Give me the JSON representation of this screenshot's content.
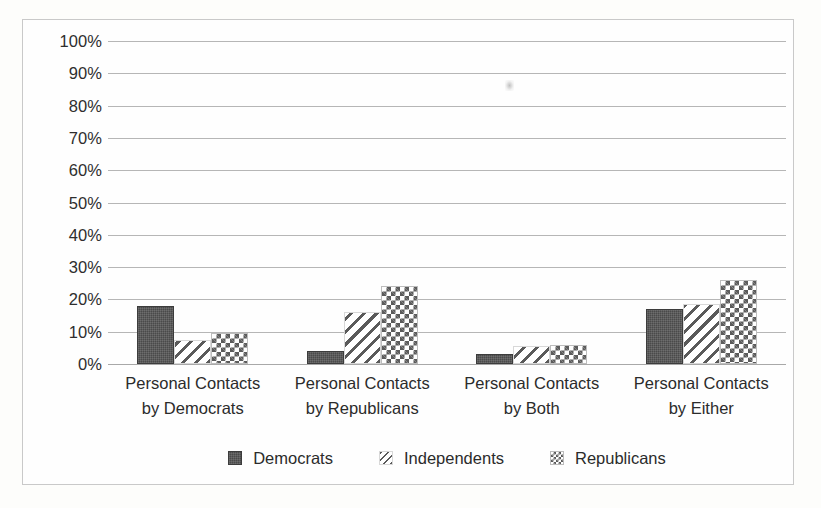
{
  "chart_data": {
    "type": "bar",
    "title": "",
    "subtitle": "",
    "xlabel": "",
    "ylabel": "",
    "ylim": [
      0,
      100
    ],
    "y_tick_labels": [
      "100%",
      "90%",
      "80%",
      "70%",
      "60%",
      "50%",
      "40%",
      "30%",
      "20%",
      "10%",
      "0%"
    ],
    "y_tick_values": [
      100,
      90,
      80,
      70,
      60,
      50,
      40,
      30,
      20,
      10,
      0
    ],
    "grid": "horizontal",
    "legend_position": "bottom",
    "categories": [
      "Personal Contacts\nby Democrats",
      "Personal Contacts\nby Republicans",
      "Personal Contacts\nby Both",
      "Personal Contacts\nby Either"
    ],
    "series": [
      {
        "name": "Democrats",
        "pattern": "solid",
        "color": "#4a4a4a",
        "values": [
          18,
          4,
          3,
          17
        ]
      },
      {
        "name": "Independents",
        "pattern": "diagonal-hatch",
        "color": "#5a5a5a",
        "values": [
          7.5,
          16,
          5.5,
          18.5
        ]
      },
      {
        "name": "Republicans",
        "pattern": "checkerboard",
        "color": "#5c5c5c",
        "values": [
          9.5,
          24,
          6,
          26
        ]
      }
    ]
  },
  "legend": {
    "items": [
      {
        "label": "Democrats"
      },
      {
        "label": "Independents"
      },
      {
        "label": "Republicans"
      }
    ]
  },
  "colors": {
    "gridline": "#b6b6b6",
    "border": "#c9c9c9",
    "text": "#2b2b2b",
    "background": "#fefefe"
  }
}
